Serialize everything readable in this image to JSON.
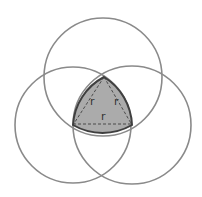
{
  "diagram": {
    "colors": {
      "background": "#ffffff",
      "circle_stroke": "#8a8a8a",
      "reuleaux_fill": "#ababab",
      "reuleaux_stroke": "#3f3f3f",
      "dash_stroke": "#3f3f3f",
      "label": "#333333"
    },
    "circles": [
      {
        "name": "top-circle",
        "cx": 103,
        "cy": 77,
        "r": 59
      },
      {
        "name": "left-circle",
        "cx": 73,
        "cy": 125,
        "r": 58
      },
      {
        "name": "right-circle",
        "cx": 132,
        "cy": 125,
        "r": 59
      }
    ],
    "vertices": {
      "top": [
        104,
        77
      ],
      "bottom_left": [
        73,
        125
      ],
      "bottom_right": [
        132,
        125
      ]
    },
    "labels": [
      {
        "name": "label-left-side",
        "text": "r",
        "x": 90,
        "y": 105
      },
      {
        "name": "label-right-side",
        "text": "r",
        "x": 114,
        "y": 105
      },
      {
        "name": "label-base",
        "text": "r",
        "x": 101,
        "y": 120
      }
    ]
  }
}
